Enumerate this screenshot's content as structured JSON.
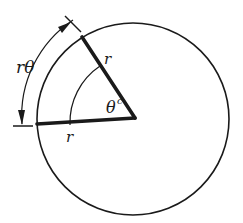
{
  "diagram": {
    "labels": {
      "arc_length": "rθ",
      "radius_upper": "r",
      "radius_lower": "r",
      "angle": "θ",
      "angle_superscript": "c"
    },
    "colors": {
      "stroke": "#1a1a1a",
      "background": "#ffffff"
    }
  }
}
